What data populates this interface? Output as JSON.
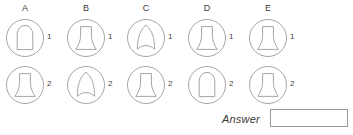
{
  "puzzle": {
    "type": "shape-matching-grid",
    "stroke_color": "#9b9b9b",
    "text_color": "#3c3c3c",
    "background_color": "#ffffff",
    "columns": [
      {
        "letter": "A",
        "cells": [
          {
            "number": "1",
            "shape": "arch-dome"
          },
          {
            "number": "2",
            "shape": "bell"
          }
        ]
      },
      {
        "letter": "B",
        "cells": [
          {
            "number": "1",
            "shape": "bell"
          },
          {
            "number": "2",
            "shape": "pointed-leaf"
          }
        ]
      },
      {
        "letter": "C",
        "cells": [
          {
            "number": "1",
            "shape": "pointed-leaf"
          },
          {
            "number": "2",
            "shape": "bell"
          }
        ]
      },
      {
        "letter": "D",
        "cells": [
          {
            "number": "1",
            "shape": "bell"
          },
          {
            "number": "2",
            "shape": "arch-dome"
          }
        ]
      },
      {
        "letter": "E",
        "cells": [
          {
            "number": "1",
            "shape": "bell"
          },
          {
            "number": "2",
            "shape": "bell"
          }
        ]
      }
    ]
  },
  "answer": {
    "label": "Answer",
    "value": "",
    "placeholder": ""
  }
}
